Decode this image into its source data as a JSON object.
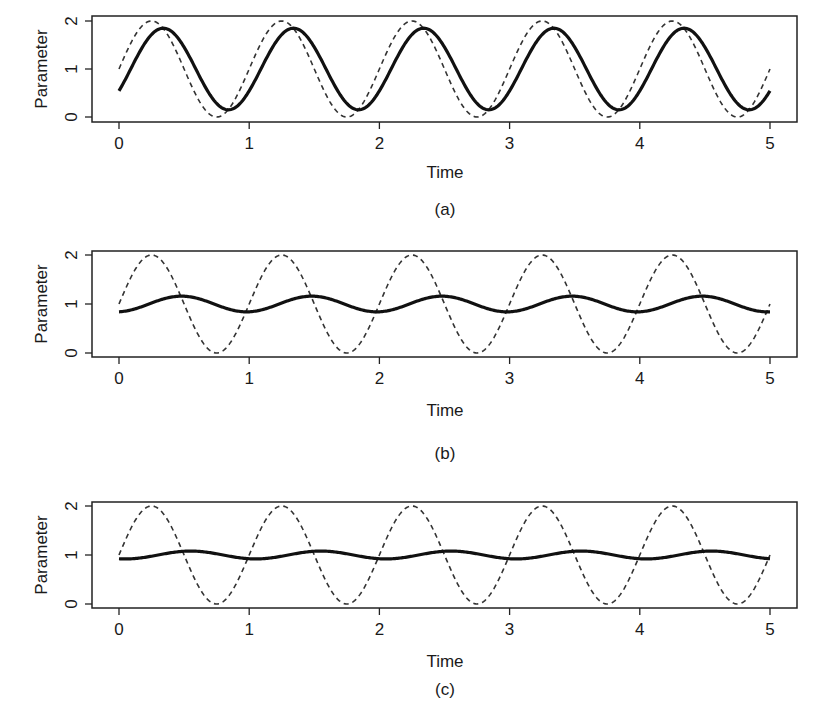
{
  "chart_data": [
    {
      "type": "line",
      "panel_label": "(a)",
      "xlabel": "Time",
      "ylabel": "Parameter",
      "xlim": [
        0,
        5
      ],
      "ylim": [
        0,
        2
      ],
      "xticks": [
        "0",
        "1",
        "2",
        "3",
        "4",
        "5"
      ],
      "yticks": [
        "0",
        "1",
        "2"
      ],
      "grid": false,
      "legend": null,
      "series": [
        {
          "name": "input (dashed)",
          "style": "dashed",
          "formula": "1 + sin(2*pi*t)",
          "mean": 1,
          "amplitude": 1.0,
          "period": 1,
          "lag": 0,
          "x": [
            0,
            0.25,
            0.5,
            0.75,
            1,
            1.25,
            1.5,
            1.75,
            2,
            2.25,
            2.5,
            2.75,
            3,
            3.25,
            3.5,
            3.75,
            4,
            4.25,
            4.5,
            4.75,
            5
          ],
          "values": [
            1,
            2,
            1,
            0,
            1,
            2,
            1,
            0,
            1,
            2,
            1,
            0,
            1,
            2,
            1,
            0,
            1,
            2,
            1,
            0,
            1
          ]
        },
        {
          "name": "response (solid)",
          "style": "solid",
          "mean": 1,
          "amplitude": 0.85,
          "period": 1,
          "lag": 0.09,
          "x": [
            0,
            0.34,
            0.84,
            1.34,
            1.84,
            2.34,
            2.84,
            3.34,
            3.84,
            4.34,
            4.84,
            5
          ],
          "values": [
            0.55,
            1.85,
            0.15,
            1.85,
            0.15,
            1.85,
            0.15,
            1.85,
            0.15,
            1.85,
            0.15,
            0.55
          ]
        }
      ]
    },
    {
      "type": "line",
      "panel_label": "(b)",
      "xlabel": "Time",
      "ylabel": "Parameter",
      "xlim": [
        0,
        5
      ],
      "ylim": [
        0,
        2
      ],
      "xticks": [
        "0",
        "1",
        "2",
        "3",
        "4",
        "5"
      ],
      "yticks": [
        "0",
        "1",
        "2"
      ],
      "grid": false,
      "legend": null,
      "series": [
        {
          "name": "input (dashed)",
          "style": "dashed",
          "formula": "1 + sin(2*pi*t)",
          "mean": 1,
          "amplitude": 1.0,
          "period": 1,
          "lag": 0,
          "x": [
            0,
            0.25,
            0.5,
            0.75,
            1,
            1.25,
            1.5,
            1.75,
            2,
            2.25,
            2.5,
            2.75,
            3,
            3.25,
            3.5,
            3.75,
            4,
            4.25,
            4.5,
            4.75,
            5
          ],
          "values": [
            1,
            2,
            1,
            0,
            1,
            2,
            1,
            0,
            1,
            2,
            1,
            0,
            1,
            2,
            1,
            0,
            1,
            2,
            1,
            0,
            1
          ]
        },
        {
          "name": "response (solid)",
          "style": "solid",
          "mean": 1,
          "amplitude": 0.16,
          "period": 1,
          "lag": 0.23,
          "x": [
            0,
            0.48,
            0.98,
            1.48,
            1.98,
            2.48,
            2.98,
            3.48,
            3.98,
            4.48,
            4.98,
            5
          ],
          "values": [
            0.85,
            1.16,
            0.84,
            1.16,
            0.84,
            1.16,
            0.84,
            1.16,
            0.84,
            1.16,
            0.84,
            0.85
          ]
        }
      ]
    },
    {
      "type": "line",
      "panel_label": "(c)",
      "xlabel": "Time",
      "ylabel": "Parameter",
      "xlim": [
        0,
        5
      ],
      "ylim": [
        0,
        2
      ],
      "xticks": [
        "0",
        "1",
        "2",
        "3",
        "4",
        "5"
      ],
      "yticks": [
        "0",
        "1",
        "2"
      ],
      "grid": false,
      "legend": null,
      "series": [
        {
          "name": "input (dashed)",
          "style": "dashed",
          "formula": "1 + sin(2*pi*t)",
          "mean": 1,
          "amplitude": 1.0,
          "period": 1,
          "lag": 0,
          "x": [
            0,
            0.25,
            0.5,
            0.75,
            1,
            1.25,
            1.5,
            1.75,
            2,
            2.25,
            2.5,
            2.75,
            3,
            3.25,
            3.5,
            3.75,
            4,
            4.25,
            4.5,
            4.75,
            5
          ],
          "values": [
            1,
            2,
            1,
            0,
            1,
            2,
            1,
            0,
            1,
            2,
            1,
            0,
            1,
            2,
            1,
            0,
            1,
            2,
            1,
            0,
            1
          ]
        },
        {
          "name": "response (solid)",
          "style": "solid",
          "mean": 1,
          "amplitude": 0.08,
          "period": 1,
          "lag": 0.3,
          "x": [
            0,
            0.55,
            1.05,
            1.55,
            2.05,
            2.55,
            3.05,
            3.55,
            4.05,
            4.55,
            5
          ],
          "values": [
            0.92,
            1.08,
            0.92,
            1.08,
            0.92,
            1.08,
            0.92,
            1.08,
            0.92,
            1.08,
            0.93
          ]
        }
      ]
    }
  ],
  "panels": [
    {
      "ylabel": "Parameter",
      "xlabel": "Time",
      "caption": "(a)",
      "xticks": [
        "0",
        "1",
        "2",
        "3",
        "4",
        "5"
      ],
      "yticks": [
        "0",
        "1",
        "2"
      ]
    },
    {
      "ylabel": "Parameter",
      "xlabel": "Time",
      "caption": "(b)",
      "xticks": [
        "0",
        "1",
        "2",
        "3",
        "4",
        "5"
      ],
      "yticks": [
        "0",
        "1",
        "2"
      ]
    },
    {
      "ylabel": "Parameter",
      "xlabel": "Time",
      "caption": "(c)",
      "xticks": [
        "0",
        "1",
        "2",
        "3",
        "4",
        "5"
      ],
      "yticks": [
        "0",
        "1",
        "2"
      ]
    }
  ],
  "colors": {
    "line": "#111111",
    "dashed_line": "#333333",
    "axis": "#222222",
    "background": "#ffffff"
  }
}
